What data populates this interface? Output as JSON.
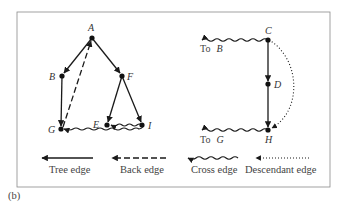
{
  "caption": "(b)",
  "colors": {
    "edge": "#1a1a1a",
    "frame": "#8a8a8a",
    "text": "#444444"
  },
  "nodes": [
    {
      "id": "A",
      "label": "A",
      "x": 92,
      "y": 38
    },
    {
      "id": "B",
      "label": "B",
      "x": 62,
      "y": 76
    },
    {
      "id": "F",
      "label": "F",
      "x": 122,
      "y": 76
    },
    {
      "id": "G",
      "label": "G",
      "x": 61,
      "y": 129
    },
    {
      "id": "E",
      "label": "E",
      "x": 107,
      "y": 125
    },
    {
      "id": "I",
      "label": "I",
      "x": 142,
      "y": 125
    },
    {
      "id": "C",
      "label": "C",
      "x": 268,
      "y": 40
    },
    {
      "id": "D",
      "label": "D",
      "x": 268,
      "y": 84
    },
    {
      "id": "H",
      "label": "H",
      "x": 268,
      "y": 130
    }
  ],
  "edges": [
    {
      "from": "A",
      "to": "B",
      "type": "tree"
    },
    {
      "from": "A",
      "to": "F",
      "type": "tree"
    },
    {
      "from": "B",
      "to": "G",
      "type": "tree"
    },
    {
      "from": "F",
      "to": "E",
      "type": "tree"
    },
    {
      "from": "F",
      "to": "I",
      "type": "tree"
    },
    {
      "from": "G",
      "to": "A",
      "type": "back"
    },
    {
      "from": "I",
      "to": "E",
      "type": "cross"
    },
    {
      "from": "I",
      "to": "G",
      "type": "cross"
    },
    {
      "from": "C",
      "to": "D",
      "type": "tree"
    },
    {
      "from": "D",
      "to": "H",
      "type": "tree"
    },
    {
      "from": "C",
      "to": "H",
      "type": "descendant"
    },
    {
      "from": "C",
      "to": "B",
      "type": "cross",
      "label": "To B"
    },
    {
      "from": "H",
      "to": "G",
      "type": "cross",
      "label": "To G"
    }
  ],
  "external_labels": {
    "to_b": "To",
    "to_b_node": "B",
    "to_g": "To",
    "to_g_node": "G"
  },
  "legend": [
    {
      "type": "tree",
      "label": "Tree edge"
    },
    {
      "type": "back",
      "label": "Back edge"
    },
    {
      "type": "cross",
      "label": "Cross edge"
    },
    {
      "type": "descendant",
      "label": "Descendant edge"
    }
  ]
}
